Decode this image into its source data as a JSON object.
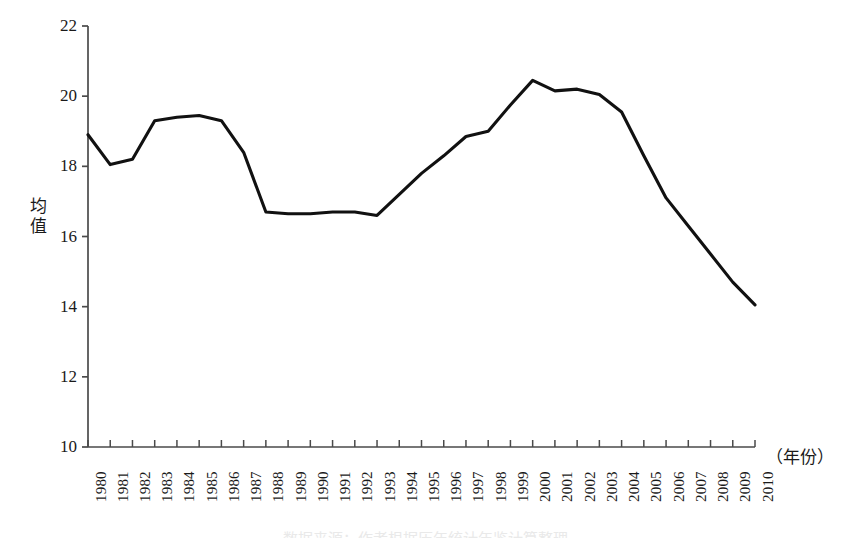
{
  "figure": {
    "background_color": "#ffffff",
    "line_color": "#111111",
    "axis_color": "#4a4a4a",
    "caption": "数据来源：作者根据历年统计年鉴计算整理"
  },
  "axes": {
    "y_title": "均\n值",
    "y_ticks": [
      "22",
      "20",
      "18",
      "16",
      "14",
      "12",
      "10"
    ],
    "x_unit_label": "（年份）",
    "x_ticks": [
      "1980",
      "1981",
      "1982",
      "1983",
      "1984",
      "1985",
      "1986",
      "1987",
      "1988",
      "1989",
      "1990",
      "1991",
      "1992",
      "1993",
      "1994",
      "1995",
      "1996",
      "1997",
      "1998",
      "1999",
      "2000",
      "2001",
      "2002",
      "2003",
      "2004",
      "2005",
      "2006",
      "2007",
      "2008",
      "2009",
      "2010"
    ]
  },
  "chart_data": {
    "type": "line",
    "title": "",
    "xlabel": "（年份）",
    "ylabel": "均值",
    "xlim": [
      1980,
      2010
    ],
    "ylim": [
      10,
      22
    ],
    "ytick_step": 2,
    "grid": false,
    "legend": false,
    "x": [
      1980,
      1981,
      1982,
      1983,
      1984,
      1985,
      1986,
      1987,
      1988,
      1989,
      1990,
      1991,
      1992,
      1993,
      1994,
      1995,
      1996,
      1997,
      1998,
      1999,
      2000,
      2001,
      2002,
      2003,
      2004,
      2005,
      2006,
      2007,
      2008,
      2009,
      2010
    ],
    "values": [
      18.9,
      18.05,
      18.2,
      19.3,
      19.4,
      19.45,
      19.3,
      18.4,
      16.7,
      16.65,
      16.65,
      16.7,
      16.7,
      16.6,
      17.2,
      17.8,
      18.3,
      18.85,
      19.0,
      19.75,
      20.45,
      20.15,
      20.2,
      20.05,
      19.55,
      18.3,
      17.1,
      16.3,
      15.5,
      14.7,
      14.05
    ],
    "series": [
      {
        "name": "均值",
        "values": [
          18.9,
          18.05,
          18.2,
          19.3,
          19.4,
          19.45,
          19.3,
          18.4,
          16.7,
          16.65,
          16.65,
          16.7,
          16.7,
          16.6,
          17.2,
          17.8,
          18.3,
          18.85,
          19.0,
          19.75,
          20.45,
          20.15,
          20.2,
          20.05,
          19.55,
          18.3,
          17.1,
          16.3,
          15.5,
          14.7,
          14.05
        ]
      }
    ]
  }
}
